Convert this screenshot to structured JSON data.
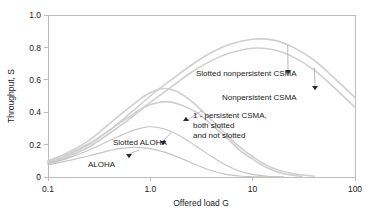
{
  "chart_data": {
    "type": "line",
    "title": "",
    "xlabel": "Offered load G",
    "ylabel": "Throughput, S",
    "xscale": "log",
    "xlim": [
      0.1,
      100
    ],
    "ylim": [
      0,
      1.0
    ],
    "grid": false,
    "legend_position": "inline-annotations",
    "xticks": [
      "0.1",
      "1.0",
      "10",
      "100"
    ],
    "xtick_values": [
      0.1,
      1.0,
      10,
      100
    ],
    "yticks": [
      "0",
      "0.2",
      "0.4",
      "0.6",
      "0.8",
      "1.0"
    ],
    "ytick_values": [
      0,
      0.2,
      0.4,
      0.6,
      0.8,
      1.0
    ],
    "series": [
      {
        "name": "Slotted nonpersistent CSMA",
        "label": "Slotted nonpersistent CSMA",
        "x": [
          0.1,
          0.15,
          0.25,
          0.4,
          0.6,
          1.0,
          1.6,
          2.5,
          4.0,
          6.0,
          10.0,
          16.0,
          25.0,
          40.0,
          63.0,
          100.0
        ],
        "values": [
          0.09,
          0.13,
          0.2,
          0.29,
          0.38,
          0.5,
          0.6,
          0.69,
          0.77,
          0.82,
          0.85,
          0.845,
          0.8,
          0.72,
          0.61,
          0.49
        ]
      },
      {
        "name": "Nonpersistent CSMA",
        "label": "Nonpersistent CSMA",
        "x": [
          0.1,
          0.15,
          0.25,
          0.4,
          0.6,
          1.0,
          1.6,
          2.5,
          4.0,
          6.0,
          10.0,
          16.0,
          25.0,
          40.0,
          63.0,
          100.0
        ],
        "values": [
          0.085,
          0.12,
          0.185,
          0.27,
          0.35,
          0.46,
          0.555,
          0.645,
          0.72,
          0.765,
          0.795,
          0.785,
          0.74,
          0.66,
          0.55,
          0.43
        ]
      },
      {
        "name": "1-persistent CSMA slotted",
        "label": "1 - persistent CSMA, both slotted and not slotted",
        "x": [
          0.1,
          0.15,
          0.25,
          0.4,
          0.6,
          0.9,
          1.3,
          1.8,
          2.5,
          3.5,
          5.0,
          7.0,
          10.0,
          15.0,
          25.0,
          40.0
        ],
        "values": [
          0.1,
          0.145,
          0.225,
          0.33,
          0.42,
          0.505,
          0.545,
          0.53,
          0.47,
          0.385,
          0.29,
          0.2,
          0.125,
          0.06,
          0.02,
          0.005
        ]
      },
      {
        "name": "1-persistent CSMA not slotted",
        "label": "1 - persistent CSMA, both slotted and not slotted",
        "x": [
          0.1,
          0.15,
          0.25,
          0.4,
          0.6,
          0.9,
          1.4,
          2.0,
          2.8,
          4.0,
          5.5,
          7.5,
          10.0,
          14.0,
          20.0,
          30.0
        ],
        "values": [
          0.095,
          0.135,
          0.205,
          0.29,
          0.365,
          0.435,
          0.465,
          0.445,
          0.4,
          0.32,
          0.245,
          0.165,
          0.11,
          0.055,
          0.02,
          0.004
        ]
      },
      {
        "name": "Slotted ALOHA",
        "label": "Slotted ALOHA",
        "x": [
          0.1,
          0.15,
          0.25,
          0.4,
          0.6,
          0.8,
          1.0,
          1.4,
          2.0,
          2.8,
          4.0,
          5.5,
          7.5,
          10.0,
          14.0,
          20.0
        ],
        "values": [
          0.082,
          0.112,
          0.165,
          0.225,
          0.275,
          0.3,
          0.31,
          0.295,
          0.25,
          0.19,
          0.125,
          0.072,
          0.035,
          0.016,
          0.005,
          0.001
        ]
      },
      {
        "name": "ALOHA",
        "label": "ALOHA",
        "x": [
          0.1,
          0.15,
          0.25,
          0.4,
          0.5,
          0.7,
          1.0,
          1.4,
          2.0,
          2.8,
          4.0,
          5.5,
          7.5,
          10.0,
          14.0,
          20.0
        ],
        "values": [
          0.075,
          0.098,
          0.13,
          0.163,
          0.175,
          0.183,
          0.175,
          0.152,
          0.115,
          0.075,
          0.038,
          0.016,
          0.006,
          0.002,
          0.0005,
          0.0001
        ]
      }
    ],
    "annotations": [
      {
        "text": "Slotted nonpersistent CSMA",
        "target_x": 22.0,
        "target_y": 0.815
      },
      {
        "text": "Nonpersistent CSMA",
        "target_x": 40.0,
        "target_y": 0.675
      },
      {
        "text": "1 - persistent CSMA,",
        "text_line2": "both slotted",
        "text_line3": "and not slotted",
        "target_x": 3.2,
        "target_y": 0.41
      },
      {
        "text": "Slotted ALOHA",
        "target_x": 1.6,
        "target_y": 0.275
      },
      {
        "text": "ALOHA",
        "target_x": 0.78,
        "target_y": 0.168
      }
    ]
  },
  "axes": {
    "y_title": "Throughput, S",
    "x_title": "Offered load G",
    "x_tick_labels": [
      "0.1",
      "1.0",
      "10",
      "100"
    ],
    "y_tick_labels": [
      "1.0",
      "0.8",
      "0.6",
      "0.4",
      "0.2",
      "0"
    ]
  },
  "labels": {
    "slotted_nonpersistent_csma": "Slotted nonpersistent CSMA",
    "nonpersistent_csma": "Nonpersistent CSMA",
    "one_persistent_line1": "1 - persistent CSMA,",
    "one_persistent_line2": "both slotted",
    "one_persistent_line3": "and not slotted",
    "slotted_aloha": "Slotted ALOHA",
    "aloha": "ALOHA"
  },
  "colors": {
    "curve": "#cfcfcf",
    "frame": "#bdbdbd",
    "text": "#1a1a1a",
    "arrow": "#2b2b2b",
    "background": "#ffffff"
  }
}
